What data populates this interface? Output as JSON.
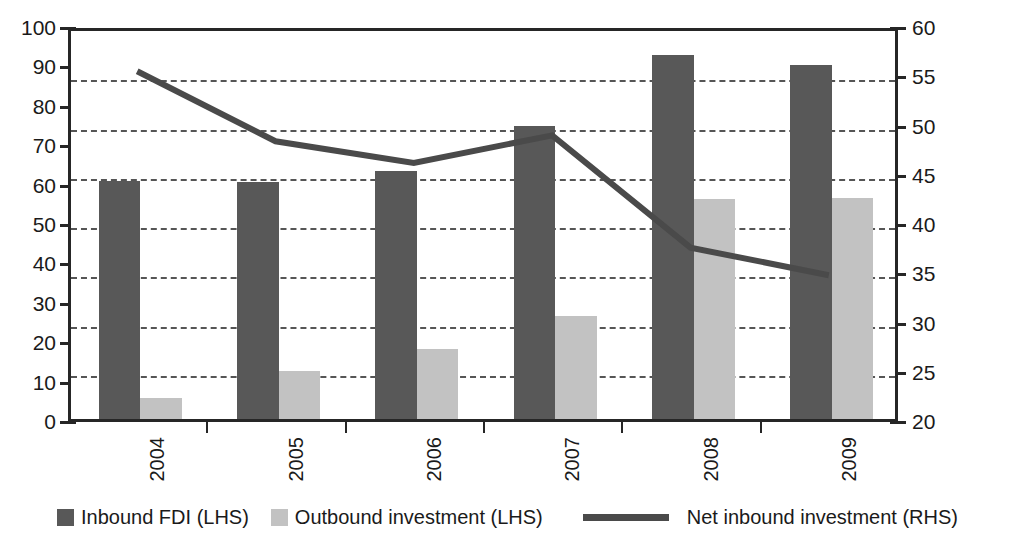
{
  "chart_data": {
    "type": "bar",
    "title": "",
    "subtitle": "",
    "xlabel": "",
    "ylabel": "",
    "categories": [
      "2004",
      "2005",
      "2006",
      "2007",
      "2008",
      "2009"
    ],
    "grid": true,
    "legend_position": "bottom",
    "axes": {
      "left": {
        "name": "LHS",
        "min": 0,
        "max": 100,
        "step": 10,
        "ticks": [
          "0",
          "10",
          "20",
          "30",
          "40",
          "50",
          "60",
          "70",
          "80",
          "90",
          "100"
        ],
        "tick_values": [
          0,
          10,
          20,
          30,
          40,
          50,
          60,
          70,
          80,
          90,
          100
        ]
      },
      "right": {
        "name": "RHS",
        "min": 20,
        "max": 60,
        "step": 5,
        "ticks": [
          "20",
          "25",
          "30",
          "35",
          "40",
          "45",
          "50",
          "55",
          "60"
        ],
        "tick_values": [
          20,
          25,
          30,
          35,
          40,
          45,
          50,
          55,
          60
        ]
      }
    },
    "series": [
      {
        "name": "Inbound FDI (LHS)",
        "type": "bar",
        "axis": "left",
        "color": "#585858",
        "values": [
          60.5,
          60.2,
          63.0,
          74.3,
          92.3,
          89.8
        ]
      },
      {
        "name": "Outbound investment (LHS)",
        "type": "bar",
        "axis": "left",
        "color": "#c2c2c2",
        "values": [
          5.3,
          12.2,
          17.8,
          26.2,
          55.8,
          56.1
        ]
      },
      {
        "name": "Net inbound investment (RHS)",
        "type": "line",
        "axis": "right",
        "color": "#4a4a4a",
        "values": [
          55.6,
          48.5,
          46.3,
          49.1,
          37.7,
          34.9
        ]
      }
    ]
  },
  "legend": {
    "items": [
      {
        "label": "Inbound FDI (LHS)",
        "marker": "square-dark-swatch"
      },
      {
        "label": "Outbound investment (LHS)",
        "marker": "square-light-swatch"
      },
      {
        "label": "Net inbound investment (RHS)",
        "marker": "line-swatch"
      }
    ]
  },
  "colors": {
    "inbound_bar": "#585858",
    "outbound_bar": "#c2c2c2",
    "net_line": "#4a4a4a",
    "axis": "#262626",
    "gridline": "#555555",
    "background": "#ffffff"
  }
}
